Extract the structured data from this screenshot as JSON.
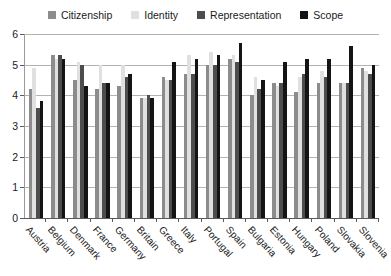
{
  "chart_data": {
    "type": "bar",
    "title": "",
    "subtitle": "",
    "xlabel": "",
    "ylabel": "",
    "ylim": [
      0,
      6
    ],
    "yticks": [
      0,
      1,
      2,
      3,
      4,
      5,
      6
    ],
    "grid": true,
    "legend_position": "top-center",
    "categories": [
      "Austria",
      "Belgium",
      "Denmark",
      "France",
      "Germany",
      "Britain",
      "Greece",
      "Italy",
      "Portugal",
      "Spain",
      "Bulgaria",
      "Estonia",
      "Hungary",
      "Poland",
      "Slovakia",
      "Slovenia"
    ],
    "series": [
      {
        "name": "Citizenship",
        "color": "#8c8c8c",
        "values": [
          4.2,
          5.3,
          4.5,
          4.2,
          4.3,
          3.9,
          4.6,
          4.7,
          5.0,
          5.2,
          4.0,
          4.4,
          4.1,
          4.4,
          4.4,
          4.9
        ]
      },
      {
        "name": "Identity",
        "color": "#e0e0e0",
        "values": [
          4.9,
          5.2,
          5.1,
          5.0,
          5.0,
          3.9,
          4.5,
          5.3,
          5.4,
          5.3,
          4.6,
          4.3,
          4.6,
          4.8,
          4.4,
          4.8
        ]
      },
      {
        "name": "Representation",
        "color": "#4d4d4d",
        "values": [
          3.6,
          5.3,
          5.0,
          4.4,
          4.6,
          4.0,
          4.5,
          4.7,
          5.0,
          5.1,
          4.2,
          4.4,
          4.7,
          4.6,
          4.4,
          4.7
        ]
      },
      {
        "name": "Scope",
        "color": "#141414",
        "values": [
          3.8,
          5.2,
          4.3,
          4.4,
          4.7,
          3.9,
          5.1,
          5.2,
          5.3,
          5.7,
          4.5,
          5.1,
          5.2,
          5.2,
          5.6,
          5.0
        ]
      }
    ]
  },
  "legend": {
    "items": [
      {
        "label": "Citizenship",
        "swatch": "legend-swatch-citizenship"
      },
      {
        "label": "Identity",
        "swatch": "legend-swatch-identity"
      },
      {
        "label": "Representation",
        "swatch": "legend-swatch-representation"
      },
      {
        "label": "Scope",
        "swatch": "legend-swatch-scope"
      }
    ]
  }
}
